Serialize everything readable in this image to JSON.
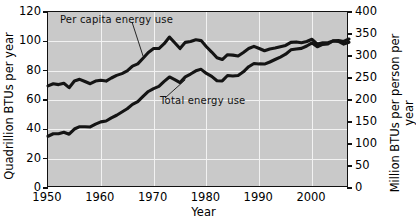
{
  "chart_data": {
    "type": "line",
    "title": "",
    "xlabel": "Year",
    "ylabel": "Quadrillion BTUs per year",
    "ylabel_right": "Million BTUs per person per year",
    "xlim": [
      1950,
      2007
    ],
    "ylim": [
      0,
      120
    ],
    "ylim_right": [
      0,
      400
    ],
    "grid": true,
    "legend": "annotations-on-curves",
    "background_color": "#c9c9c9",
    "gridline_color": "#f2f2f2",
    "series_color": "#141414",
    "xticks": [
      1950,
      1960,
      1970,
      1980,
      1990,
      2000
    ],
    "xtick_labels": [
      "1950",
      "1960",
      "1970",
      "1980",
      "1990",
      "2000"
    ],
    "yticks_left": [
      0,
      20,
      40,
      60,
      80,
      100,
      120
    ],
    "ytick_labels_left": [
      "0",
      "20",
      "40",
      "60",
      "80",
      "100",
      "120"
    ],
    "yticks_right": [
      0,
      50,
      100,
      150,
      200,
      250,
      300,
      350,
      400
    ],
    "ytick_labels_right": [
      "0",
      "50",
      "100",
      "150",
      "200",
      "250",
      "300",
      "350",
      "400"
    ],
    "x": [
      1950,
      1951,
      1952,
      1953,
      1954,
      1955,
      1956,
      1957,
      1958,
      1959,
      1960,
      1961,
      1962,
      1963,
      1964,
      1965,
      1966,
      1967,
      1968,
      1969,
      1970,
      1971,
      1972,
      1973,
      1974,
      1975,
      1976,
      1977,
      1978,
      1979,
      1980,
      1981,
      1982,
      1983,
      1984,
      1985,
      1986,
      1987,
      1988,
      1989,
      1990,
      1991,
      1992,
      1993,
      1994,
      1995,
      1996,
      1997,
      1998,
      1999,
      2000,
      2001,
      2002,
      2003,
      2004,
      2005,
      2006,
      2007
    ],
    "series": [
      {
        "name": "Per capita energy use",
        "axis": "right",
        "units": "Million BTUs per person per year",
        "annotation": "Per capita energy use",
        "values": [
          232,
          237,
          235,
          238,
          228,
          243,
          247,
          242,
          237,
          243,
          245,
          243,
          250,
          256,
          260,
          266,
          277,
          282,
          295,
          308,
          317,
          317,
          328,
          343,
          330,
          317,
          331,
          333,
          337,
          335,
          321,
          309,
          296,
          292,
          303,
          302,
          300,
          308,
          317,
          322,
          317,
          312,
          316,
          318,
          321,
          324,
          331,
          332,
          330,
          333,
          338,
          327,
          330,
          330,
          334,
          333,
          327,
          331
        ]
      },
      {
        "name": "Total energy use",
        "axis": "left",
        "units": "Quadrillion BTUs per year",
        "annotation": "Total energy use",
        "values": [
          35.3,
          37.0,
          37.0,
          38.0,
          36.7,
          40.2,
          41.8,
          41.8,
          41.6,
          43.5,
          45.1,
          45.7,
          47.8,
          49.6,
          51.8,
          54.0,
          57.0,
          58.9,
          62.4,
          65.8,
          67.8,
          69.3,
          72.7,
          75.7,
          73.9,
          71.9,
          75.8,
          77.7,
          79.9,
          80.9,
          78.1,
          76.1,
          73.1,
          73.0,
          76.7,
          76.4,
          76.7,
          79.2,
          82.7,
          84.9,
          84.6,
          84.5,
          85.9,
          87.6,
          89.3,
          91.2,
          94.2,
          94.8,
          95.2,
          96.8,
          98.9,
          96.3,
          97.9,
          98.2,
          100.4,
          100.5,
          99.9,
          101.6
        ]
      }
    ]
  },
  "axes": {
    "x_title": "Year",
    "y_title_left": "Quadrillion BTUs per year",
    "y_title_right": "Million BTUs per person per year"
  },
  "annotations": {
    "per_capita": "Per capita energy use",
    "total": "Total energy use"
  }
}
